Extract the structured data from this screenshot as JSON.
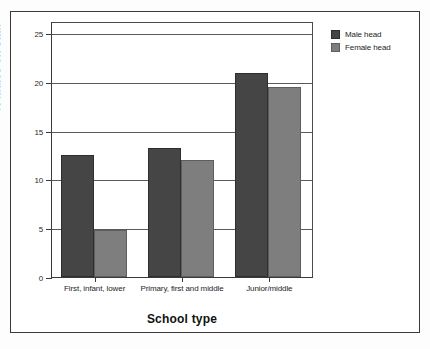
{
  "chart_data": {
    "type": "bar",
    "title": "",
    "xlabel": "School type",
    "ylabel": "% males on staff",
    "categories": [
      "First, infant, lower",
      "Primary, first and middle",
      "Junior/middle"
    ],
    "series": [
      {
        "name": "Male head",
        "color": "#454545",
        "values": [
          12.5,
          13.2,
          20.9
        ]
      },
      {
        "name": "Female head",
        "color": "#7e7e7e",
        "values": [
          4.8,
          12.0,
          19.5
        ]
      }
    ],
    "ylim": [
      0,
      25
    ],
    "yticks": [
      0,
      5,
      10,
      15,
      20,
      25
    ],
    "ytick_labels": [
      "0",
      "5",
      "10",
      "15",
      "20",
      "25"
    ],
    "grid": true,
    "legend_position": "right"
  },
  "legend": {
    "entries": [
      {
        "label": "Male head"
      },
      {
        "label": "Female head"
      }
    ]
  }
}
